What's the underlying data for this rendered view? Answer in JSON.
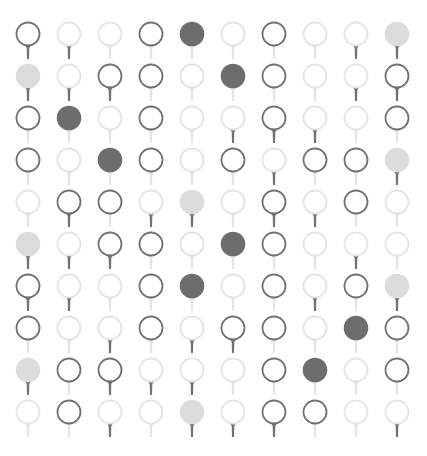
{
  "grid": {
    "rows": 10,
    "cols": 10,
    "origin_x": 28,
    "origin_y": 34,
    "col_spacing": 41.0,
    "row_spacing": 42.0,
    "ball_radius": 11.5,
    "legend": {
      "ball": {
        "D": "dark-outline ball",
        "L": "light-outline ball",
        "F": "dark-filled ball",
        "G": "light-filled ball"
      },
      "tee": {
        "d": "dark tee",
        "l": "light tee"
      }
    },
    "cells": [
      [
        "Dd",
        "Ld",
        "Ll",
        "Dl",
        "Fl",
        "Ll",
        "Dl",
        "Ll",
        "Ld",
        "Gd"
      ],
      [
        "Gd",
        "Ld",
        "Dd",
        "Dl",
        "Ll",
        "Fl",
        "Dl",
        "Ll",
        "Ld",
        "Dd"
      ],
      [
        "Dl",
        "Fl",
        "Ll",
        "Dl",
        "Ll",
        "Ld",
        "Dd",
        "Ld",
        "Ll",
        "Dl"
      ],
      [
        "Dl",
        "Ll",
        "Fl",
        "Dl",
        "Ll",
        "Dl",
        "Ld",
        "Dl",
        "Dl",
        "Gd"
      ],
      [
        "Ll",
        "Dd",
        "Dl",
        "Ld",
        "Gd",
        "Ll",
        "Dd",
        "Ld",
        "Dl",
        "Ll"
      ],
      [
        "Gd",
        "Ld",
        "Dd",
        "Dl",
        "Ll",
        "Fl",
        "Dl",
        "Ll",
        "Ld",
        "Ll"
      ],
      [
        "Dd",
        "Ld",
        "Ll",
        "Dl",
        "Fl",
        "Ll",
        "Dl",
        "Ld",
        "Dl",
        "Gd"
      ],
      [
        "Dl",
        "Ll",
        "Ld",
        "Dl",
        "Ld",
        "Dd",
        "Dl",
        "Ll",
        "Fl",
        "Dl"
      ],
      [
        "Gd",
        "Dl",
        "Dd",
        "Ld",
        "Ld",
        "Ll",
        "Dl",
        "Fl",
        "Ll",
        "Dl"
      ],
      [
        "Ll",
        "Dl",
        "Ld",
        "Ll",
        "Gd",
        "Ld",
        "Dd",
        "Dl",
        "Ll",
        "Ld"
      ]
    ]
  },
  "colors": {
    "background": "#ffffff",
    "dark_stroke": "#717171",
    "light_stroke": "#e4e4e4",
    "dark_fill": "#6d6d6d",
    "light_fill": "#dcdcdc",
    "dark_tee": "#717171",
    "light_tee": "#e4e4e4"
  }
}
